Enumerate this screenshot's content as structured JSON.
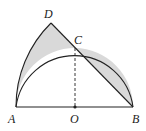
{
  "diagram": {
    "type": "geometry",
    "points": {
      "A": {
        "label": "A",
        "x": 16,
        "y": 107
      },
      "B": {
        "label": "B",
        "x": 133,
        "y": 107
      },
      "O": {
        "label": "O",
        "x": 75,
        "y": 107
      },
      "C": {
        "label": "C",
        "x": 75,
        "y": 48
      },
      "D": {
        "label": "D",
        "x": 51,
        "y": 23
      }
    },
    "labels": {
      "A": "A",
      "B": "B",
      "O": "O",
      "C": "C",
      "D": "D"
    },
    "colors": {
      "stroke": "#222222",
      "shade": "#d9d9d9",
      "background": "#ffffff"
    }
  }
}
